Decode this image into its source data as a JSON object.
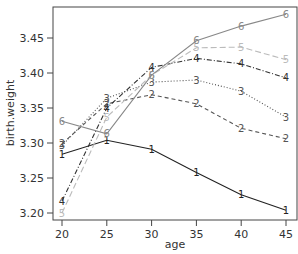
{
  "chart_data": {
    "type": "line",
    "title": "",
    "xlabel": "age",
    "ylabel": "birth.weight",
    "x": [
      20,
      25,
      30,
      35,
      40,
      45
    ],
    "xticks": [
      20,
      25,
      30,
      35,
      40,
      45
    ],
    "yticks": [
      3.2,
      3.25,
      3.3,
      3.35,
      3.4,
      3.45
    ],
    "ytick_labels": [
      "3.20",
      "3.25",
      "3.30",
      "3.35",
      "3.40",
      "3.45"
    ],
    "xlim": [
      19.0,
      46.2
    ],
    "ylim": [
      3.19,
      3.494
    ],
    "grid": false,
    "legend": "none (series identified by point-label digits 1-6)",
    "series": [
      {
        "name": "1",
        "marker": "1",
        "color": "#222222",
        "dash": "solid",
        "values": [
          3.284,
          3.304,
          3.291,
          3.258,
          3.226,
          3.204
        ]
      },
      {
        "name": "2",
        "marker": "2",
        "color": "#555555",
        "dash": "dashed",
        "values": [
          3.299,
          3.356,
          3.369,
          3.356,
          3.321,
          3.306
        ]
      },
      {
        "name": "3",
        "marker": "3",
        "color": "#555555",
        "dash": "dotted",
        "values": [
          3.296,
          3.364,
          3.387,
          3.39,
          3.374,
          3.337
        ]
      },
      {
        "name": "4",
        "marker": "4",
        "color": "#333333",
        "dash": "dashdot",
        "values": [
          3.217,
          3.35,
          3.408,
          3.421,
          3.413,
          3.393
        ]
      },
      {
        "name": "5",
        "marker": "5",
        "color": "#bbbbbb",
        "dash": "longdash",
        "values": [
          3.2,
          3.337,
          3.397,
          3.436,
          3.437,
          3.419
        ]
      },
      {
        "name": "6",
        "marker": "6",
        "color": "#888888",
        "dash": "solid",
        "values": [
          3.331,
          3.313,
          3.397,
          3.446,
          3.467,
          3.484
        ]
      }
    ]
  }
}
